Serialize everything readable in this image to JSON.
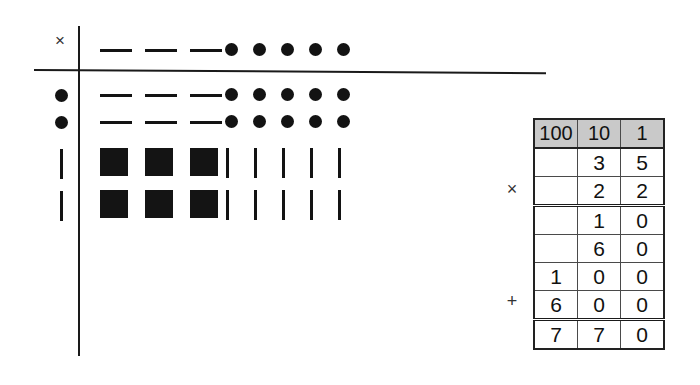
{
  "diagram": {
    "operator_symbol": "×",
    "axis": {
      "vertical": "vertical-rule",
      "horizontal": "horizontal-rule"
    },
    "row_labels": [
      "×",
      "●",
      "●",
      "|",
      "|"
    ],
    "rows": [
      {
        "label": "×",
        "glyphs": [
          "dash",
          "dash",
          "dash",
          "dot",
          "dot",
          "dot",
          "dot",
          "dot"
        ]
      },
      {
        "label": "●",
        "glyphs": [
          "dash",
          "dash",
          "dash",
          "dot",
          "dot",
          "dot",
          "dot",
          "dot"
        ]
      },
      {
        "label": "●",
        "glyphs": [
          "dash",
          "dash",
          "dash",
          "dot",
          "dot",
          "dot",
          "dot",
          "dot"
        ]
      },
      {
        "label": "|",
        "glyphs": [
          "square",
          "square",
          "square",
          "bar",
          "bar",
          "bar",
          "bar",
          "bar"
        ]
      },
      {
        "label": "|",
        "glyphs": [
          "square",
          "square",
          "square",
          "bar",
          "bar",
          "bar",
          "bar",
          "bar"
        ]
      }
    ]
  },
  "table": {
    "headers": [
      "100",
      "10",
      "1"
    ],
    "operators": {
      "multiply": "×",
      "add": "+"
    },
    "rows": [
      {
        "cells": [
          "",
          "3",
          "5"
        ],
        "op": "",
        "rule_below": false
      },
      {
        "cells": [
          "",
          "2",
          "2"
        ],
        "op": "×",
        "rule_below": true
      },
      {
        "cells": [
          "",
          "1",
          "0"
        ],
        "op": "",
        "rule_below": false
      },
      {
        "cells": [
          "",
          "6",
          "0"
        ],
        "op": "",
        "rule_below": false
      },
      {
        "cells": [
          "1",
          "0",
          "0"
        ],
        "op": "",
        "rule_below": false
      },
      {
        "cells": [
          "6",
          "0",
          "0"
        ],
        "op": "+",
        "rule_below": true
      },
      {
        "cells": [
          "7",
          "7",
          "0"
        ],
        "op": "",
        "rule_below": false
      }
    ]
  },
  "colors": {
    "ink": "#131313",
    "header_fill": "#c9c9c9",
    "grid": "#4a4a4a",
    "border": "#222222"
  }
}
